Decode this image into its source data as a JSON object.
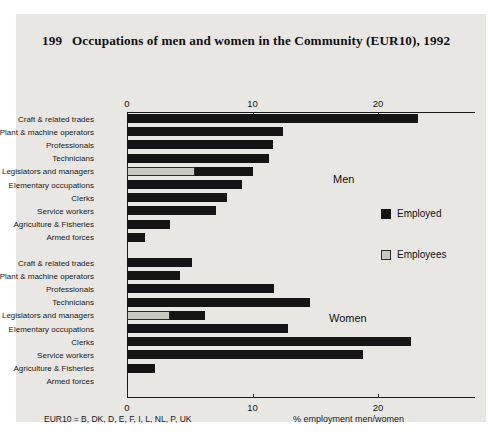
{
  "figure": {
    "title_number": "199",
    "title_text": "Occupations of men and women in the Community (EUR10), 1992",
    "footnote": "EUR10 = B, DK, D, E, F, I, L, NL, P, UK",
    "axis_caption": "% employment men/women",
    "group_men_label": "Men",
    "group_women_label": "Women"
  },
  "legend": {
    "employed_label": "Employed",
    "employees_label": "Employees",
    "employed_color": "#141414",
    "employees_color": "#c9c9c4"
  },
  "axis": {
    "ticks": [
      "0",
      "10",
      "20"
    ],
    "tick_values": [
      0,
      10,
      20
    ],
    "min": 0,
    "max": 25.5
  },
  "chart_data": {
    "type": "bar",
    "orientation": "horizontal",
    "xlabel": "% employment men/women",
    "ylabel": "",
    "xlim": [
      0,
      25.5
    ],
    "xticks": [
      0,
      10,
      20
    ],
    "grid": false,
    "legend": [
      "Employed",
      "Employees"
    ],
    "legend_position": "right",
    "note": "EUR10 = B, DK, D, E, F, I, L, NL, P, UK",
    "panels": [
      {
        "name": "Men",
        "categories": [
          "Craft & related trades",
          "Plant & machine operators",
          "Professionals",
          "Technicians",
          "Legislators and managers",
          "Elementary occupations",
          "Clerks",
          "Service workers",
          "Agriculture & Fisheries",
          "Armed forces"
        ],
        "series": [
          {
            "name": "Employed",
            "values": [
              23.2,
              12.4,
              11.6,
              11.3,
              10.0,
              9.2,
              8.0,
              7.1,
              3.4,
              1.4
            ]
          },
          {
            "name": "Employees",
            "values": [
              null,
              null,
              null,
              null,
              5.4,
              null,
              null,
              null,
              null,
              null
            ]
          }
        ]
      },
      {
        "name": "Women",
        "categories": [
          "Craft & related trades",
          "Plant & machine operators",
          "Professionals",
          "Technicians",
          "Legislators and managers",
          "Elementary occupations",
          "Clerks",
          "Service workers",
          "Agriculture & Fisheries",
          "Armed forces"
        ],
        "series": [
          {
            "name": "Employed",
            "values": [
              5.2,
              4.2,
              11.7,
              14.6,
              6.2,
              12.8,
              22.6,
              18.8,
              2.2,
              0.1
            ]
          },
          {
            "name": "Employees",
            "values": [
              null,
              null,
              null,
              null,
              3.4,
              null,
              null,
              null,
              null,
              null
            ]
          }
        ]
      }
    ]
  }
}
